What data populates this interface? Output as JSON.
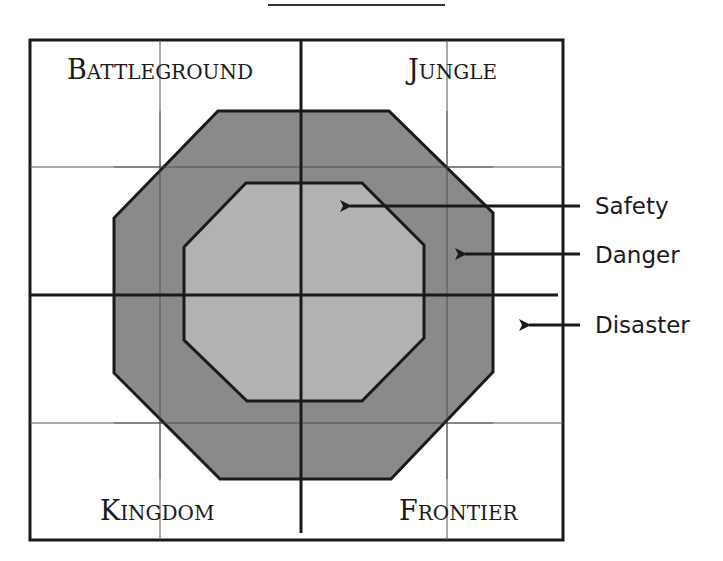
{
  "diagram": {
    "quadrants": {
      "top_left": {
        "first": "B",
        "rest": "ATTLEGROUND"
      },
      "top_right": {
        "first": "J",
        "rest": "UNGLE"
      },
      "bottom_left": {
        "first": "K",
        "rest": "INGDOM"
      },
      "bottom_right": {
        "first": "F",
        "rest": "RONTIER"
      }
    },
    "zones": [
      {
        "label": "Safety",
        "region": "inner octagon",
        "color": "#b4b4b4"
      },
      {
        "label": "Danger",
        "region": "outer octagon ring",
        "color": "#808080"
      },
      {
        "label": "Disaster",
        "region": "outside octagons",
        "color": "#ffffff"
      }
    ],
    "colors": {
      "stroke": "#1a1a1a",
      "grid": "#555555"
    }
  }
}
